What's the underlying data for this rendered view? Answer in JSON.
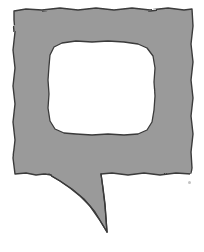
{
  "artwork": {
    "title": "Speech Bubble",
    "description": "Hand-drawn gray speech balloon with blank white interior and a pointed tail",
    "alt_text": "Empty speech bubble outline",
    "style": "hand-drawn ink and gray wash",
    "canvas": {
      "width": 204,
      "height": 252,
      "background_color": "#ffffff"
    },
    "colors": {
      "fill_gray": "#9a9a9a",
      "outline_dark": "#3a3a3a",
      "interior_white": "#ffffff",
      "speck_gray": "#b9b9b9"
    },
    "shapes": {
      "balloon_body": {
        "name": "balloon-body",
        "fill": "#9a9a9a",
        "stroke": "#3a3a3a",
        "stroke_width": 1.4,
        "path": "M14,11 L26,9 L42,10 L60,8 L78,10 L96,8 L114,10 L132,8 L150,10 L168,8 L184,10 L192,9 L193,26 L191,44 L193,62 L191,80 L193,98 L191,116 L193,134 L191,152 L192,168 L191,174 L176,173 L160,175 L144,173 L128,175 L112,173 L101,174 L103,188 L105,204 L106,218 L107,232 L99,219 L90,206 L80,196 L70,188 L60,181 L50,175 L44,174 L36,175 L26,173 L15,174 L13,158 L15,140 L13,122 L15,104 L13,86 L15,68 L13,50 L15,32 L14,20 Z"
      },
      "balloon_interior": {
        "name": "balloon-interior",
        "fill": "#ffffff",
        "stroke": "#3a3a3a",
        "stroke_width": 1.3,
        "path": "M62,43 L76,41 L92,42 L108,41 L124,42 L138,44 L147,48 L153,56 L155,68 L154,82 L155,96 L154,110 L152,122 L147,130 L138,134 L124,135 L108,134 L92,135 L76,134 L64,133 L55,129 L50,121 L48,108 L49,94 L48,80 L49,66 L50,55 L54,47 Z"
      },
      "tail": {
        "name": "balloon-tail",
        "tip_x": 107,
        "tip_y": 232,
        "base_left_x": 48,
        "base_right_x": 101,
        "base_y": 174
      }
    },
    "artifacts": [
      {
        "name": "scan-speck",
        "x": 188,
        "y": 181,
        "size": 3,
        "color": "#b9b9b9"
      }
    ]
  }
}
